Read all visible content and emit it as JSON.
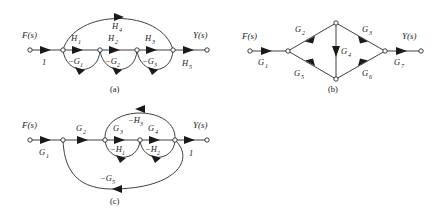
{
  "figure": {
    "background": "#ffffff",
    "ink": "#1a1a1a",
    "captions": {
      "a": "(a)",
      "b": "(b)",
      "c": "(c)"
    }
  },
  "diagram_a": {
    "caption": "(a)",
    "input_label": "F(s)",
    "output_label": "Y(s)",
    "edges": [
      {
        "name": "input-gain",
        "label": "1",
        "from": "n0",
        "to": "n1",
        "type": "forward"
      },
      {
        "name": "h1",
        "label": "H",
        "sub": "1",
        "from": "n1",
        "to": "n2",
        "type": "forward"
      },
      {
        "name": "h2",
        "label": "H",
        "sub": "2",
        "from": "n2",
        "to": "n3",
        "type": "forward"
      },
      {
        "name": "h3",
        "label": "H",
        "sub": "3",
        "from": "n3",
        "to": "n4",
        "type": "forward"
      },
      {
        "name": "h5",
        "label": "H",
        "sub": "5",
        "from": "n4",
        "to": "n5",
        "type": "forward"
      },
      {
        "name": "h4",
        "label": "H",
        "sub": "4",
        "from": "n1",
        "to": "n4",
        "type": "feedforward-arc"
      },
      {
        "name": "g1-feedback",
        "label": "−G",
        "sub": "1",
        "from": "n2",
        "to": "n1",
        "type": "feedback-arc"
      },
      {
        "name": "g2-feedback",
        "label": "−G",
        "sub": "2",
        "from": "n3",
        "to": "n2",
        "type": "feedback-arc"
      },
      {
        "name": "g3-feedback",
        "label": "−G",
        "sub": "3",
        "from": "n4",
        "to": "n3",
        "type": "feedback-arc"
      }
    ]
  },
  "diagram_b": {
    "caption": "(b)",
    "input_label": "F(s)",
    "output_label": "Y(s)",
    "edges": [
      {
        "name": "g1",
        "label": "G",
        "sub": "1",
        "from": "in",
        "to": "left",
        "type": "forward"
      },
      {
        "name": "g2",
        "label": "G",
        "sub": "2",
        "from": "left",
        "to": "top",
        "type": "upper-left"
      },
      {
        "name": "g3",
        "label": "G",
        "sub": "3",
        "from": "top",
        "to": "right",
        "type": "upper-right"
      },
      {
        "name": "g4",
        "label": "G",
        "sub": "4",
        "from": "top",
        "to": "bottom",
        "type": "vertical-down"
      },
      {
        "name": "g5",
        "label": "G",
        "sub": "5",
        "from": "left",
        "to": "bottom",
        "type": "lower-left"
      },
      {
        "name": "g6",
        "label": "G",
        "sub": "6",
        "from": "bottom",
        "to": "right",
        "type": "lower-right"
      },
      {
        "name": "g7",
        "label": "G",
        "sub": "7",
        "from": "right",
        "to": "out",
        "type": "forward"
      }
    ]
  },
  "diagram_c": {
    "caption": "(c)",
    "input_label": "F(s)",
    "output_label": "Y(s)",
    "edges": [
      {
        "name": "g1",
        "label": "G",
        "sub": "1",
        "from": "m0",
        "to": "m1",
        "type": "forward"
      },
      {
        "name": "g2",
        "label": "G",
        "sub": "2",
        "from": "m1",
        "to": "m2",
        "type": "forward"
      },
      {
        "name": "g3",
        "label": "G",
        "sub": "3",
        "from": "m2",
        "to": "m3",
        "type": "forward"
      },
      {
        "name": "g4",
        "label": "G",
        "sub": "4",
        "from": "m3",
        "to": "m4",
        "type": "forward"
      },
      {
        "name": "output-gain",
        "label": "1",
        "from": "m4",
        "to": "m5",
        "type": "forward"
      },
      {
        "name": "h3-feedback",
        "label": "−H",
        "sub": "3",
        "from": "m4",
        "to": "m2",
        "type": "feedback-arc-top"
      },
      {
        "name": "h1-feedback",
        "label": "−H",
        "sub": "1",
        "from": "m3",
        "to": "m2",
        "type": "feedback-arc"
      },
      {
        "name": "h2-feedback",
        "label": "−H",
        "sub": "2",
        "from": "m4",
        "to": "m3",
        "type": "feedback-arc"
      },
      {
        "name": "g5-feedback",
        "label": "−G",
        "sub": "5",
        "from": "m4",
        "to": "m1",
        "type": "feedback-arc-large"
      }
    ]
  }
}
